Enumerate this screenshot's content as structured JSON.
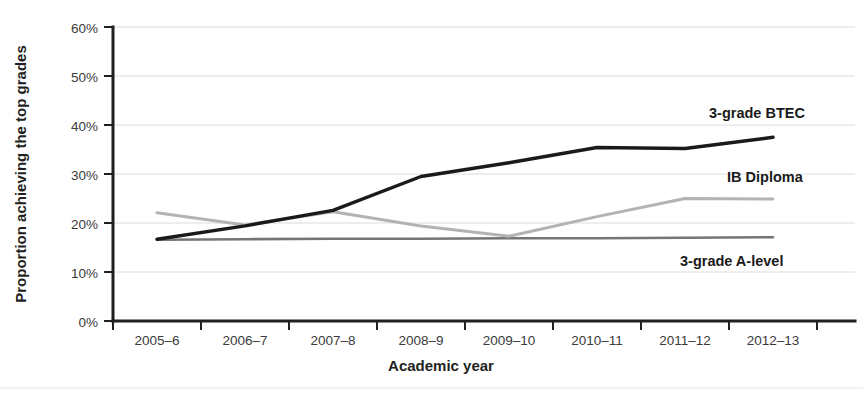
{
  "chart_data": {
    "type": "line",
    "title": "",
    "subtitle": "",
    "xlabel": "Academic year",
    "ylabel": "Proportion achieving the top grades",
    "categories": [
      "2005–6",
      "2006–7",
      "2007–8",
      "2008–9",
      "2009–10",
      "2010–11",
      "2011–12",
      "2012–13"
    ],
    "x": [
      "2005–6",
      "2006–7",
      "2007–8",
      "2008–9",
      "2009–10",
      "2010–11",
      "2011–12",
      "2012–13"
    ],
    "ylim": [
      0,
      60
    ],
    "yticks": [
      0,
      10,
      20,
      30,
      40,
      50,
      60
    ],
    "ytick_labels": [
      "0%",
      "10%",
      "20%",
      "30%",
      "40%",
      "50%",
      "60%"
    ],
    "grid": true,
    "legend": "inline-right-annotations",
    "units": "percent",
    "series": [
      {
        "name": "3-grade BTEC",
        "color": "#1a1a1a",
        "line_width": 3.4,
        "values": [
          16.7,
          19.4,
          22.6,
          29.5,
          32.3,
          35.4,
          35.2,
          37.5
        ],
        "label_position": {
          "x": 709,
          "y": 118
        }
      },
      {
        "name": "IB Diploma",
        "color": "#b3b3b3",
        "line_width": 3.0,
        "values": [
          22.1,
          19.6,
          22.3,
          19.4,
          17.3,
          21.3,
          25.0,
          24.9
        ],
        "label_position": {
          "x": 727,
          "y": 182
        }
      },
      {
        "name": "3-grade A-level",
        "color": "#757575",
        "line_width": 2.6,
        "values": [
          16.6,
          16.7,
          16.8,
          16.8,
          16.9,
          16.9,
          17.0,
          17.1
        ],
        "label_position": {
          "x": 680,
          "y": 266
        }
      }
    ]
  },
  "axis": {
    "y_title": "Proportion achieving the top grades",
    "x_title": "Academic year"
  },
  "y_tick_labels": [
    "60%",
    "50%",
    "40%",
    "30%",
    "20%",
    "10%",
    "0%"
  ],
  "x_tick_labels": [
    "2005–6",
    "2006–7",
    "2007–8",
    "2008–9",
    "2009–10",
    "2010–11",
    "2011–12",
    "2012–13"
  ],
  "series_labels": {
    "btec": "3-grade BTEC",
    "ib": "IB Diploma",
    "alevel": "3-grade A-level"
  },
  "colors": {
    "btec": "#1a1a1a",
    "ib": "#b3b3b3",
    "alevel": "#757575",
    "grid": "#dcdcdc",
    "axis": "#231f20",
    "background": "#ffffff"
  }
}
